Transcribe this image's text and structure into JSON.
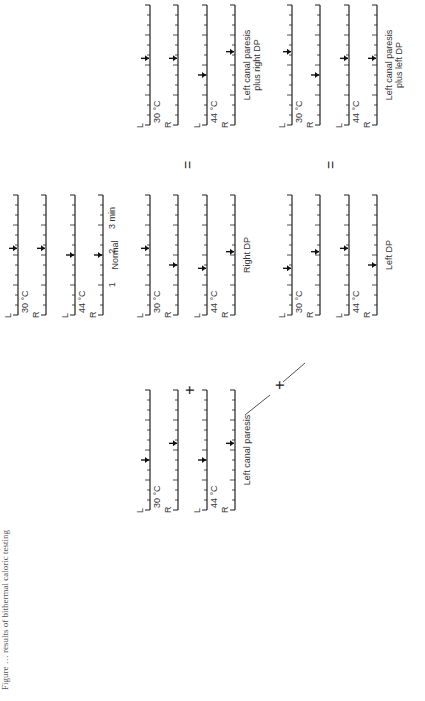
{
  "figure": {
    "orientation": "rotated 90 degrees counter-clockwise",
    "caption_partial": "Figure … results of bithermal caloric testing",
    "time_axis": {
      "ticks": [
        "1",
        "2",
        "3 min"
      ]
    },
    "row_labels": {
      "left": "L",
      "right": "R",
      "cold": "30 °C",
      "warm": "44 °C"
    },
    "operators": {
      "plus": "+",
      "equals": "="
    },
    "panels": [
      {
        "id": "normal",
        "label": "Normal",
        "arrows_min": {
          "L30": 2.0,
          "R30": 2.0,
          "L44": 1.8,
          "R44": 1.8
        }
      },
      {
        "id": "right-dp",
        "label": "Right DP",
        "arrows_min": {
          "L30": 2.0,
          "R30": 1.5,
          "L44": 1.4,
          "R44": 1.9
        }
      },
      {
        "id": "left-dp",
        "label": "Left DP",
        "arrows_min": {
          "L30": 1.4,
          "R30": 1.9,
          "L44": 2.0,
          "R44": 1.5
        }
      },
      {
        "id": "left-canal-paresis",
        "label": "Left canal paresis",
        "arrows_min": {
          "L30": 1.5,
          "R30": 2.0,
          "L44": 1.5,
          "R44": 2.0
        }
      },
      {
        "id": "lcp-plus-right-dp",
        "label": "Left canal paresis plus right DP",
        "arrows_min": {
          "L30": 2.0,
          "R30": 2.0,
          "L44": 1.5,
          "R44": 2.2
        }
      },
      {
        "id": "lcp-plus-left-dp",
        "label": "Left canal paresis plus left DP",
        "arrows_min": {
          "L30": 2.2,
          "R30": 1.5,
          "L44": 2.0,
          "R44": 2.0
        }
      }
    ]
  }
}
